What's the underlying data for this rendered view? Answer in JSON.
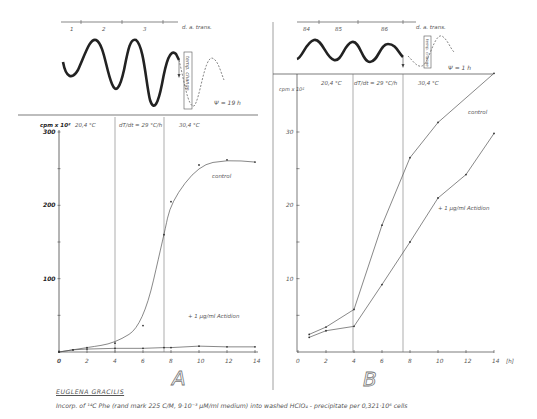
{
  "figure": {
    "caption_title": "EUGLENA GRACILIS",
    "caption_text": "Incorp. of ¹⁴C Phe (rand mark 225 C/M, 9·10⁻³ µM/ml medium) into washed HClO₄ - precipitate per 0,321·10⁶ cells",
    "colors": {
      "line": "#555555",
      "axis": "#444444",
      "text": "#555555",
      "background": "#ffffff"
    }
  },
  "chart_data": [
    {
      "id": "A",
      "panel_label": "A",
      "type": "line",
      "title": "",
      "xlabel": "",
      "ylabel": "cpm x 10²",
      "xlim": [
        0,
        14
      ],
      "ylim": [
        0,
        300
      ],
      "x_ticks": [
        "0",
        "2",
        "4",
        "6",
        "8",
        "10",
        "12",
        "14"
      ],
      "y_ticks": [
        "0",
        "100",
        "200",
        "300"
      ],
      "grid": false,
      "phase_labels": [
        "20,4 °C",
        "dT/dt = 29 °C/h",
        "30,4 °C"
      ],
      "phase_boundaries_h": [
        4,
        7.5
      ],
      "rhythm": {
        "axis_label": "d. a. trans.",
        "cycles": [
          "1",
          "2",
          "3"
        ],
        "annotation": "temp. change",
        "phase_shift": "Ψ = 19 h"
      },
      "series": [
        {
          "name": "control",
          "x": [
            0,
            1,
            2,
            4,
            6,
            7.5,
            8,
            10,
            12,
            14
          ],
          "values": [
            0,
            3,
            6,
            12,
            36,
            160,
            205,
            255,
            262,
            259
          ]
        },
        {
          "name": "+ 1 µg/ml Actidion",
          "x": [
            0,
            1,
            2,
            4,
            6,
            7.5,
            8,
            10,
            12,
            14
          ],
          "values": [
            0,
            3,
            4,
            5,
            5,
            6,
            6,
            8,
            7,
            7
          ]
        }
      ]
    },
    {
      "id": "B",
      "panel_label": "B",
      "type": "line",
      "title": "",
      "xlabel": "[h]",
      "ylabel": "cpm x 10²",
      "xlim": [
        0,
        14
      ],
      "ylim": [
        0,
        35
      ],
      "x_ticks": [
        "0",
        "2",
        "4",
        "6",
        "8",
        "10",
        "12",
        "14"
      ],
      "y_ticks": [
        "10",
        "20",
        "30"
      ],
      "grid": false,
      "phase_labels": [
        "20,4 °C",
        "dT/dt = 29 °C/h",
        "30,4 °C"
      ],
      "phase_boundaries_h": [
        4,
        7.5
      ],
      "rhythm": {
        "axis_label": "d. a. trans.",
        "cycles": [
          "84",
          "85",
          "86"
        ],
        "annotation": "temp. change",
        "phase_shift": "Ψ = 1 h"
      },
      "series": [
        {
          "name": "control",
          "x": [
            0.8,
            2,
            4,
            6,
            8,
            10,
            14
          ],
          "values": [
            2.4,
            3.4,
            5.8,
            17.3,
            26.5,
            31.3,
            38.0
          ]
        },
        {
          "name": "+ 1 µg/ml Actidion",
          "x": [
            0.8,
            2,
            4,
            6,
            8,
            10,
            12,
            14
          ],
          "values": [
            2.0,
            2.9,
            3.5,
            9.2,
            15.0,
            21.0,
            24.2,
            29.8
          ]
        }
      ]
    }
  ]
}
